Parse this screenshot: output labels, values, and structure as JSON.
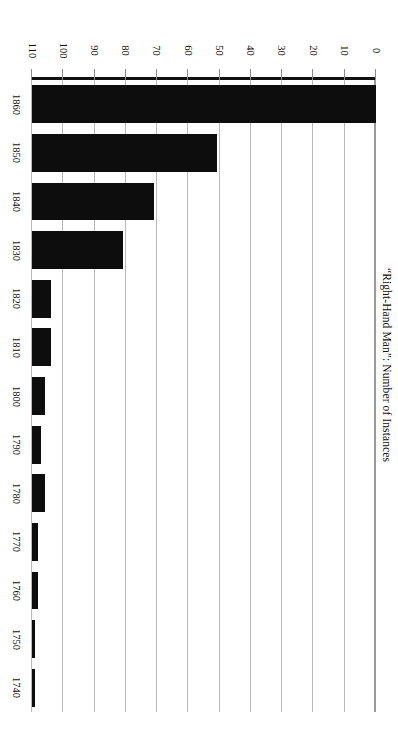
{
  "chart_data": {
    "type": "bar",
    "orientation": "horizontal",
    "rotated_180": true,
    "title": "",
    "xlabel": "“Right-Hand Man”: Number of Instances",
    "ylabel": "",
    "categories": [
      "1740",
      "1750",
      "1760",
      "1770",
      "1780",
      "1790",
      "1800",
      "1810",
      "1820",
      "1830",
      "1840",
      "1850",
      "1860"
    ],
    "values": [
      1,
      1,
      2,
      2,
      4,
      3,
      4,
      6,
      6,
      29,
      39,
      59,
      110
    ],
    "xlim": [
      0,
      110
    ],
    "ylim": [
      0,
      110
    ],
    "tick_labels": [
      "0",
      "10",
      "20",
      "30",
      "40",
      "50",
      "60",
      "70",
      "80",
      "90",
      "100",
      "110"
    ],
    "tick_values": [
      0,
      10,
      20,
      30,
      40,
      50,
      60,
      70,
      80,
      90,
      100,
      110
    ],
    "grid": true,
    "legend": null,
    "bar_color": "#0d0d0d",
    "gridline_color": "#b9b9b9",
    "background_color": "#ffffff"
  },
  "axis": {
    "value_axis_label": "“Right-Hand Man”: Number of Instances"
  }
}
